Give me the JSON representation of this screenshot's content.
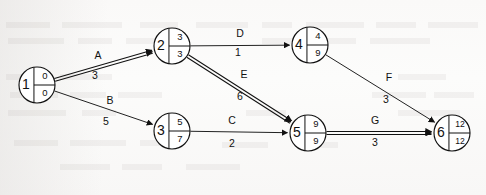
{
  "diagram": {
    "type": "aoa-network",
    "canvas": {
      "width": 486,
      "height": 195
    },
    "colors": {
      "background": "#fcfcfb",
      "stroke": "#111111",
      "edge": "#222222",
      "node_fill": "#ffffff"
    },
    "node_legend": {
      "left_cell": "event-number",
      "top_right_cell": "earliest-event-time",
      "bottom_right_cell": "latest-event-time"
    },
    "nodes": [
      {
        "id": "1",
        "earliest": "0",
        "latest": "0",
        "cx": 37,
        "cy": 85,
        "r": 18
      },
      {
        "id": "2",
        "earliest": "3",
        "latest": "3",
        "cx": 172,
        "cy": 46,
        "r": 18
      },
      {
        "id": "3",
        "earliest": "5",
        "latest": "7",
        "cx": 172,
        "cy": 131,
        "r": 18
      },
      {
        "id": "4",
        "earliest": "4",
        "latest": "9",
        "cx": 310,
        "cy": 45,
        "r": 18
      },
      {
        "id": "5",
        "earliest": "9",
        "latest": "9",
        "cx": 308,
        "cy": 133,
        "r": 18
      },
      {
        "id": "6",
        "earliest": "12",
        "latest": "12",
        "cx": 452,
        "cy": 133,
        "r": 18
      }
    ],
    "edges": [
      {
        "name": "A",
        "duration": "3",
        "from": "1",
        "to": "2",
        "critical": true,
        "label_x": 98,
        "label_y": 56,
        "dur_x": 95,
        "dur_y": 76
      },
      {
        "name": "B",
        "duration": "5",
        "from": "1",
        "to": "3",
        "critical": false,
        "label_x": 110,
        "label_y": 101,
        "dur_x": 106,
        "dur_y": 122
      },
      {
        "name": "C",
        "duration": "2",
        "from": "3",
        "to": "5",
        "critical": false,
        "label_x": 232,
        "label_y": 121,
        "dur_x": 232,
        "dur_y": 144
      },
      {
        "name": "D",
        "duration": "1",
        "from": "2",
        "to": "4",
        "critical": false,
        "label_x": 240,
        "label_y": 34,
        "dur_x": 238,
        "dur_y": 53
      },
      {
        "name": "E",
        "duration": "6",
        "from": "2",
        "to": "5",
        "critical": true,
        "label_x": 244,
        "label_y": 75,
        "dur_x": 240,
        "dur_y": 97
      },
      {
        "name": "F",
        "duration": "3",
        "from": "4",
        "to": "6",
        "critical": false,
        "label_x": 389,
        "label_y": 78,
        "dur_x": 386,
        "dur_y": 100
      },
      {
        "name": "G",
        "duration": "3",
        "from": "5",
        "to": "6",
        "critical": true,
        "label_x": 375,
        "label_y": 121,
        "dur_x": 375,
        "dur_y": 143
      }
    ]
  }
}
